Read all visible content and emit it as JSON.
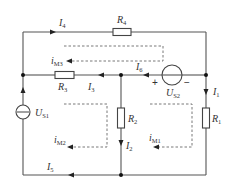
{
  "diagram": {
    "type": "circuit-schematic",
    "components": {
      "R4": {
        "symbol": "R",
        "sub": "4"
      },
      "R3": {
        "symbol": "R",
        "sub": "3"
      },
      "R2": {
        "symbol": "R",
        "sub": "2"
      },
      "R1": {
        "symbol": "R",
        "sub": "1"
      },
      "US1": {
        "symbol": "U",
        "sub": "S1"
      },
      "US2": {
        "symbol": "U",
        "sub": "S2",
        "plus": "+",
        "minus": "−"
      }
    },
    "currents": {
      "I1": {
        "symbol": "I",
        "sub": "1"
      },
      "I2": {
        "symbol": "I",
        "sub": "2"
      },
      "I3": {
        "symbol": "I",
        "sub": "3"
      },
      "I4": {
        "symbol": "I",
        "sub": "4"
      },
      "I5": {
        "symbol": "I",
        "sub": "5"
      },
      "I6": {
        "symbol": "I",
        "sub": "6"
      }
    },
    "mesh_currents": {
      "IM1": {
        "symbol": "i",
        "sub": "M1"
      },
      "IM2": {
        "symbol": "i",
        "sub": "M2"
      },
      "IM3": {
        "symbol": "i",
        "sub": "M3"
      }
    },
    "colors": {
      "wire": "#555555",
      "node": "#111111",
      "dashed_loop": "#6a6a6a",
      "text": "#333333"
    }
  }
}
